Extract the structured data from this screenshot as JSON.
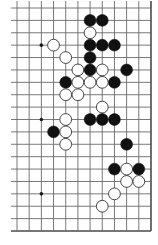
{
  "board": {
    "description": "Go board diagram, bottom-right region (cropped top and left)",
    "origin_x": 17,
    "origin_y": 8,
    "spacing_x": 12.18,
    "spacing_y": 12.39,
    "columns": 12,
    "rows": 19,
    "stub_left": 6,
    "stub_top": 7,
    "edges": {
      "right": true,
      "bottom": true,
      "left": false,
      "top": false
    },
    "stone_radius": 5.9,
    "colors": {
      "background": "#ffffff",
      "line": "#6a6a6a",
      "black": "#111111",
      "white": "#ffffff"
    },
    "hoshi": [
      [
        2,
        3
      ],
      [
        2,
        9
      ],
      [
        2,
        15
      ]
    ],
    "stones": [
      {
        "c": 6,
        "r": 1,
        "color": "black"
      },
      {
        "c": 7,
        "r": 1,
        "color": "black"
      },
      {
        "c": 6,
        "r": 2,
        "color": "white"
      },
      {
        "c": 3,
        "r": 3,
        "color": "white"
      },
      {
        "c": 6,
        "r": 3,
        "color": "black"
      },
      {
        "c": 7,
        "r": 3,
        "color": "black"
      },
      {
        "c": 8,
        "r": 3,
        "color": "black"
      },
      {
        "c": 4,
        "r": 4,
        "color": "white"
      },
      {
        "c": 6,
        "r": 4,
        "color": "black"
      },
      {
        "c": 5,
        "r": 5,
        "color": "white"
      },
      {
        "c": 6,
        "r": 5,
        "color": "black"
      },
      {
        "c": 7,
        "r": 5,
        "color": "white"
      },
      {
        "c": 9,
        "r": 5,
        "color": "black"
      },
      {
        "c": 4,
        "r": 6,
        "color": "black"
      },
      {
        "c": 5,
        "r": 6,
        "color": "white"
      },
      {
        "c": 6,
        "r": 6,
        "color": "white"
      },
      {
        "c": 7,
        "r": 6,
        "color": "white"
      },
      {
        "c": 8,
        "r": 6,
        "color": "black"
      },
      {
        "c": 4,
        "r": 7,
        "color": "white"
      },
      {
        "c": 5,
        "r": 7,
        "color": "white"
      },
      {
        "c": 7,
        "r": 8,
        "color": "white"
      },
      {
        "c": 4,
        "r": 9,
        "color": "white"
      },
      {
        "c": 6,
        "r": 9,
        "color": "black"
      },
      {
        "c": 7,
        "r": 9,
        "color": "black"
      },
      {
        "c": 8,
        "r": 9,
        "color": "black"
      },
      {
        "c": 3,
        "r": 10,
        "color": "black"
      },
      {
        "c": 4,
        "r": 10,
        "color": "white"
      },
      {
        "c": 4,
        "r": 11,
        "color": "white"
      },
      {
        "c": 9,
        "r": 11,
        "color": "black"
      },
      {
        "c": 8,
        "r": 13,
        "color": "black"
      },
      {
        "c": 9,
        "r": 13,
        "color": "white"
      },
      {
        "c": 10,
        "r": 13,
        "color": "black"
      },
      {
        "c": 9,
        "r": 14,
        "color": "white"
      },
      {
        "c": 10,
        "r": 14,
        "color": "white"
      },
      {
        "c": 8,
        "r": 15,
        "color": "white"
      },
      {
        "c": 7,
        "r": 16,
        "color": "white"
      }
    ]
  }
}
